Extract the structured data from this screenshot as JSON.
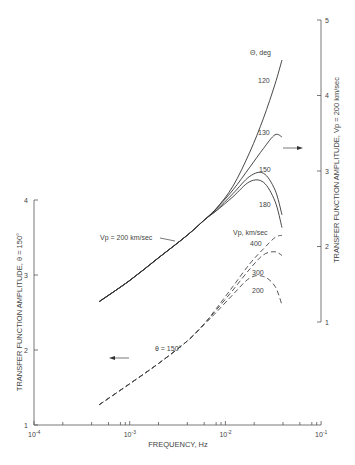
{
  "chart_data": {
    "type": "line",
    "title": "",
    "xlabel": "FREQUENCY, Hz",
    "xscale": "log",
    "xlim": [
      0.0001,
      0.1
    ],
    "x_ticks": [
      "10^-4",
      "10^-3",
      "10^-2",
      "10^-1"
    ],
    "y_left": {
      "label": "TRANSFER FUNCTION AMPLITUDE, θ = 150°",
      "ylim": [
        1,
        4
      ],
      "ticks": [
        "1",
        "2",
        "3",
        "4"
      ],
      "applies_to": "dashed curves (arrow pointing left)"
    },
    "y_right": {
      "label": "TRANSFER FUNCTION AMPLITUDE, Vp = 200 km/sec",
      "ylim": [
        1,
        5
      ],
      "ticks": [
        "1",
        "2",
        "3",
        "4",
        "5"
      ],
      "applies_to": "solid curves (arrow pointing right)"
    },
    "grid": false,
    "annotations": [
      "Θ, deg",
      "Vp, km/sec",
      "Vp = 200 km/sec",
      "θ = 150°"
    ],
    "series": [
      {
        "name": "Θ = 120°",
        "group": "solid",
        "axis": "right",
        "label": "120",
        "x": [
          0.00048,
          0.001,
          0.002,
          0.004,
          0.006,
          0.008,
          0.012,
          0.018,
          0.025,
          0.033,
          0.039
        ],
        "y": [
          1.27,
          1.55,
          1.85,
          2.15,
          2.35,
          2.5,
          2.8,
          3.25,
          3.7,
          4.15,
          4.47
        ]
      },
      {
        "name": "Θ = 130°",
        "group": "solid",
        "axis": "right",
        "label": "130",
        "x": [
          0.00048,
          0.001,
          0.002,
          0.004,
          0.006,
          0.008,
          0.012,
          0.018,
          0.025,
          0.033,
          0.039
        ],
        "y": [
          1.27,
          1.55,
          1.85,
          2.15,
          2.35,
          2.5,
          2.75,
          3.05,
          3.3,
          3.48,
          3.45
        ]
      },
      {
        "name": "Θ = 150°",
        "group": "solid",
        "axis": "right",
        "label": "150",
        "x": [
          0.00048,
          0.001,
          0.002,
          0.004,
          0.006,
          0.008,
          0.012,
          0.018,
          0.025,
          0.033,
          0.039
        ],
        "y": [
          1.27,
          1.55,
          1.85,
          2.15,
          2.35,
          2.48,
          2.7,
          2.93,
          2.97,
          2.75,
          2.42
        ]
      },
      {
        "name": "Θ = 180°",
        "group": "solid",
        "axis": "right",
        "label": "180",
        "x": [
          0.00048,
          0.001,
          0.002,
          0.004,
          0.006,
          0.008,
          0.012,
          0.018,
          0.025,
          0.033,
          0.039
        ],
        "y": [
          1.27,
          1.55,
          1.85,
          2.15,
          2.35,
          2.47,
          2.66,
          2.86,
          2.85,
          2.6,
          2.25
        ]
      },
      {
        "name": "Vp = 400 km/sec",
        "group": "dashed",
        "axis": "left",
        "label": "400",
        "x": [
          0.00048,
          0.001,
          0.002,
          0.004,
          0.006,
          0.008,
          0.012,
          0.018,
          0.025,
          0.033,
          0.039
        ],
        "y": [
          1.27,
          1.55,
          1.82,
          2.12,
          2.35,
          2.55,
          2.85,
          3.15,
          3.35,
          3.5,
          3.53
        ]
      },
      {
        "name": "Vp = 300 km/sec",
        "group": "dashed",
        "axis": "left",
        "label": "300",
        "x": [
          0.00048,
          0.001,
          0.002,
          0.004,
          0.006,
          0.008,
          0.012,
          0.018,
          0.025,
          0.033,
          0.039
        ],
        "y": [
          1.27,
          1.55,
          1.82,
          2.12,
          2.35,
          2.53,
          2.8,
          3.08,
          3.27,
          3.31,
          3.26
        ]
      },
      {
        "name": "Vp = 200 km/sec",
        "group": "dashed",
        "axis": "left",
        "label": "200",
        "x": [
          0.00048,
          0.001,
          0.002,
          0.004,
          0.006,
          0.008,
          0.012,
          0.018,
          0.025,
          0.033,
          0.039
        ],
        "y": [
          1.27,
          1.55,
          1.82,
          2.12,
          2.34,
          2.5,
          2.74,
          2.96,
          2.98,
          2.85,
          2.6
        ]
      }
    ]
  },
  "labels": {
    "xlabel": "FREQUENCY, Hz",
    "y_left_label": "TRANSFER FUNCTION AMPLITUDE, θ = 150°",
    "y_right_label": "TRANSFER FUNCTION AMPLITUDE, Vp = 200 km/sec",
    "theta_header": "Θ, deg",
    "vp_header": "Vp, km/sec",
    "solid_note": "Vp = 200 km/sec",
    "dashed_note": "θ = 150°",
    "curve_labels": {
      "c120": "120",
      "c130": "130",
      "c150": "150",
      "c180": "180",
      "v400": "400",
      "v300": "300",
      "v200": "200"
    }
  },
  "ticks": {
    "x": [
      {
        "pos": -4,
        "label": "10",
        "exp": "-4"
      },
      {
        "pos": -3,
        "label": "10",
        "exp": "-3"
      },
      {
        "pos": -2,
        "label": "10",
        "exp": "-2"
      },
      {
        "pos": -1,
        "label": "10",
        "exp": "-1"
      }
    ],
    "left": [
      "1",
      "2",
      "3",
      "4"
    ],
    "right": [
      "1",
      "2",
      "3",
      "4",
      "5"
    ]
  }
}
